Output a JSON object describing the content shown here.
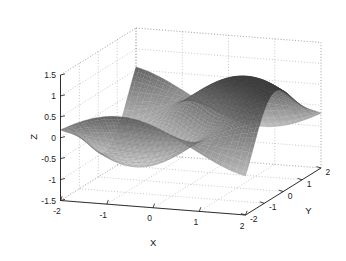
{
  "figure": {
    "background_color": "#ffffff",
    "plot_type": "3d-surface",
    "colormap": "gray",
    "mesh": "fine-grid",
    "box": "on",
    "grid": "dotted"
  },
  "axes": {
    "x": {
      "label": "X",
      "ticks": [
        "-2",
        "-1",
        "0",
        "1",
        "2"
      ],
      "tick_values": [
        -2,
        -1,
        0,
        1,
        2
      ],
      "range": [
        -2,
        2
      ]
    },
    "y": {
      "label": "Y",
      "ticks": [
        "-2",
        "-1",
        "0",
        "1",
        "2"
      ],
      "tick_values": [
        -2,
        -1,
        0,
        1,
        2
      ],
      "range": [
        -2,
        2
      ]
    },
    "z": {
      "label": "Z",
      "ticks": [
        "1.5",
        "1",
        "0.5",
        "0",
        "-0.5",
        "-1",
        "-1.5"
      ],
      "tick_values": [
        1.5,
        1,
        0.5,
        0,
        -0.5,
        -1,
        -1.5
      ],
      "range": [
        -1.5,
        1.5
      ]
    }
  },
  "chart_data": {
    "type": "surface",
    "title": "",
    "xlabel": "X",
    "ylabel": "Y",
    "zlabel": "Z",
    "xlim": [
      -2,
      2
    ],
    "ylim": [
      -2,
      2
    ],
    "zlim": [
      -1.5,
      1.5
    ],
    "xticks": [
      -2,
      -1,
      0,
      1,
      2
    ],
    "yticks": [
      -2,
      -1,
      0,
      1,
      2
    ],
    "zticks": [
      -1.5,
      -1,
      -0.5,
      0,
      0.5,
      1,
      1.5
    ],
    "grid": true,
    "legend": "none",
    "colormap": "gray",
    "shading": "height-based grayscale, dark at peaks",
    "surface_function": "z = sin(x)*cos(y) + 0.6*sin(2*y)*cos(x)",
    "grid_resolution": 56,
    "view": {
      "azimuth": -37.5,
      "elevation": 30
    },
    "x": [
      -2,
      -1.8571,
      -1.7143,
      -1.5714,
      -1.4286,
      -1.2857,
      -1.1429,
      -1,
      -0.8571,
      -0.7143,
      -0.5714,
      -0.4286,
      -0.2857,
      -0.1429,
      0,
      0.1429,
      0.2857,
      0.4286,
      0.5714,
      0.7143,
      0.8571,
      1,
      1.1429,
      1.2857,
      1.4286,
      1.5714,
      1.7143,
      1.8571,
      2
    ],
    "y": [
      -2,
      -1.8571,
      -1.7143,
      -1.5714,
      -1.4286,
      -1.2857,
      -1.1429,
      -1,
      -0.8571,
      -0.7143,
      -0.5714,
      -0.4286,
      -0.2857,
      -0.1429,
      0,
      0.1429,
      0.2857,
      0.4286,
      0.5714,
      0.7143,
      0.8571,
      1,
      1.1429,
      1.2857,
      1.4286,
      1.5714,
      1.7143,
      1.8571,
      2
    ],
    "z_min": -1.5,
    "z_max": 1.5,
    "features": [
      {
        "name": "left-ridge-crest",
        "approx_z": 1.2,
        "location": "x near -1, y near 0.5"
      },
      {
        "name": "right-peak",
        "approx_z": 1.45,
        "location": "x near 1.2, y near 1.5"
      },
      {
        "name": "central-valley",
        "approx_z": -1.35,
        "location": "x near 0.3, y near -0.8"
      },
      {
        "name": "front-spike",
        "approx_z": 1.1,
        "location": "x near -0.2, y near 2"
      }
    ]
  }
}
